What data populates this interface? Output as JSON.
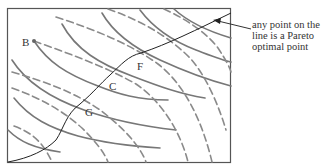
{
  "figure": {
    "points": [
      {
        "id": "B",
        "label": "B"
      },
      {
        "id": "F",
        "label": "F"
      },
      {
        "id": "C",
        "label": "C"
      },
      {
        "id": "G",
        "label": "G"
      }
    ],
    "annotation": {
      "lines": [
        "any point on the",
        "line is a Pareto",
        "optimal point"
      ]
    },
    "colors": {
      "frame": "#555555",
      "solid_curves": "#777777",
      "dashed_curves": "#8a8a8a",
      "contract_curve": "#222222",
      "text": "#333333"
    }
  }
}
